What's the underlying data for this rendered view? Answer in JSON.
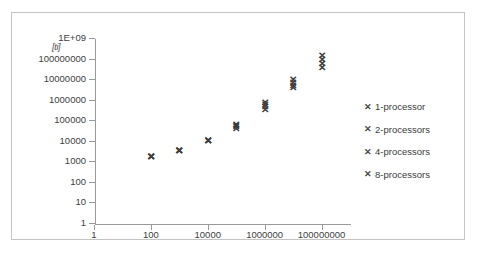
{
  "chart_data": {
    "type": "scatter",
    "title": "",
    "xlabel": "",
    "ylabel": "[ti]",
    "xscale": "log",
    "yscale": "log",
    "grid": false,
    "legend_position": "right",
    "x_ticks": [
      "1",
      "100",
      "10000",
      "1000000",
      "100000000"
    ],
    "x_tick_values": [
      1,
      100,
      10000,
      1000000,
      100000000
    ],
    "y_ticks": [
      "1E+09",
      "100000000",
      "10000000",
      "1000000",
      "100000",
      "10000",
      "1000",
      "100",
      "10",
      "1"
    ],
    "y_tick_values": [
      1000000000,
      100000000,
      10000000,
      1000000,
      100000,
      10000,
      1000,
      100,
      10,
      1
    ],
    "xlim": [
      1,
      1000000000
    ],
    "ylim": [
      1,
      1000000000
    ],
    "x": [
      100,
      1000,
      10000,
      100000,
      1000000,
      10000000,
      100000000
    ],
    "series": [
      {
        "name": "1-processor",
        "marker": "x",
        "values": [
          1700,
          3100,
          10000,
          60000,
          700000,
          9000000,
          130000000
        ]
      },
      {
        "name": "2-processors",
        "marker": "x",
        "values": [
          1700,
          3100,
          10000,
          52000,
          560000,
          6500000,
          85000000
        ]
      },
      {
        "name": "4-processors",
        "marker": "x",
        "values": [
          1700,
          3100,
          10000,
          45000,
          420000,
          4600000,
          52000000
        ]
      },
      {
        "name": "8-processors",
        "marker": "x",
        "values": [
          1700,
          3100,
          10000,
          38000,
          330000,
          3500000,
          36000000
        ]
      }
    ]
  },
  "legend": {
    "marker_glyph": "✕",
    "entries": [
      {
        "label": "1-processor"
      },
      {
        "label": "2-processors"
      },
      {
        "label": "4-processors"
      },
      {
        "label": "8-processors"
      }
    ]
  },
  "colors": {
    "marker": "#3d3d3d",
    "axis": "#9a9a9a",
    "border": "#c4c4c4",
    "text": "#3a3a3a",
    "background": "#ffffff"
  }
}
